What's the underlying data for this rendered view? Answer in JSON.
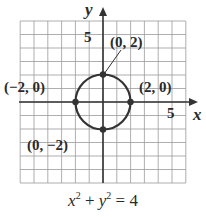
{
  "chart_data": {
    "type": "scatter",
    "title": "",
    "equation": "x^2 + y^2 = 4",
    "xlabel": "x",
    "ylabel": "y",
    "xlim": [
      -6,
      6
    ],
    "ylim": [
      -6,
      6
    ],
    "grid": true,
    "x_tick_label": "5",
    "y_tick_label": "5",
    "curve": {
      "shape": "circle",
      "center": [
        0,
        0
      ],
      "radius": 2
    },
    "points": [
      {
        "x": 0,
        "y": 2,
        "label": "(0, 2)"
      },
      {
        "x": -2,
        "y": 0,
        "label": "(−2, 0)"
      },
      {
        "x": 2,
        "y": 0,
        "label": "(2, 0)"
      },
      {
        "x": 0,
        "y": -2,
        "label": "(0, −2)"
      }
    ]
  },
  "labels": {
    "x_axis": "x",
    "y_axis": "y",
    "x_tick": "5",
    "y_tick": "5",
    "p_top": "(0, 2)",
    "p_left": "(−2, 0)",
    "p_right": "(2, 0)",
    "p_bottom": "(0, −2)",
    "eq_x": "x",
    "eq_exp1": "2",
    "eq_plus": " + ",
    "eq_y": "y",
    "eq_exp2": "2",
    "eq_rhs": " = 4"
  }
}
